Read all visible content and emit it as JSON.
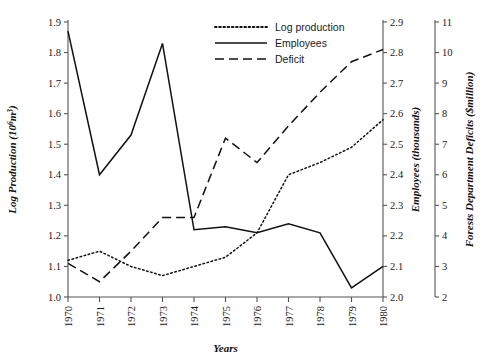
{
  "chart_data": {
    "type": "line",
    "title": "",
    "xlabel": "Years",
    "grid": false,
    "legend_position": "top-center",
    "categories": [
      1970,
      1971,
      1972,
      1973,
      1974,
      1975,
      1976,
      1977,
      1978,
      1979,
      1980
    ],
    "x_tick_labels": [
      "1970",
      "1971",
      "1972",
      "1973",
      "1974",
      "1975",
      "1976",
      "1977",
      "1978",
      "1979",
      "1980"
    ],
    "axes": [
      {
        "id": "left",
        "label": "Log Production (10⁶m³)",
        "label_plain": "Log Production",
        "label_unit_base": "(10",
        "label_unit_exp": "6",
        "label_unit_tail": "m",
        "label_unit_exp2": "3",
        "label_unit_close": ")",
        "side": "left",
        "lim": [
          1.0,
          1.9
        ],
        "ticks": [
          "1.0",
          "1.1",
          "1.2",
          "1.3",
          "1.4",
          "1.5",
          "1.6",
          "1.7",
          "1.8",
          "1.9"
        ],
        "tick_values": [
          1.0,
          1.1,
          1.2,
          1.3,
          1.4,
          1.5,
          1.6,
          1.7,
          1.8,
          1.9
        ]
      },
      {
        "id": "right1",
        "label": "Employees (thousands)",
        "side": "right",
        "lim": [
          2.0,
          2.9
        ],
        "ticks": [
          "2.0",
          "2.1",
          "2.2",
          "2.3",
          "2.4",
          "2.5",
          "2.6",
          "2.7",
          "2.8",
          "2.9"
        ],
        "tick_values": [
          2.0,
          2.1,
          2.2,
          2.3,
          2.4,
          2.5,
          2.6,
          2.7,
          2.8,
          2.9
        ]
      },
      {
        "id": "right2",
        "label": "Forests Department Deficits ($million)",
        "side": "right-outer",
        "lim": [
          2,
          11
        ],
        "ticks": [
          "2",
          "3",
          "4",
          "5",
          "6",
          "7",
          "8",
          "9",
          "10",
          "11"
        ],
        "tick_values": [
          2,
          3,
          4,
          5,
          6,
          7,
          8,
          9,
          10,
          11
        ]
      }
    ],
    "series": [
      {
        "name": "Log production",
        "legend_label": "Log production",
        "style": "dotted",
        "axis": "left",
        "color": "#111111",
        "values": [
          1.12,
          1.15,
          1.1,
          1.07,
          1.1,
          1.13,
          1.21,
          1.4,
          1.44,
          1.49,
          1.58
        ]
      },
      {
        "name": "Employees",
        "legend_label": "Employees",
        "style": "solid",
        "axis": "right1",
        "color": "#111111",
        "values": [
          2.87,
          2.4,
          2.53,
          2.83,
          2.22,
          2.23,
          2.21,
          2.24,
          2.21,
          2.03,
          2.1
        ]
      },
      {
        "name": "Deficit",
        "legend_label": "Deficit",
        "style": "dashed",
        "axis": "right1",
        "color": "#111111",
        "values_on_employee_scale": [
          2.11,
          2.05,
          2.15,
          2.26,
          2.26,
          2.52,
          2.44,
          2.56,
          2.67,
          2.77,
          2.81
        ],
        "values": [
          3.1,
          2.5,
          3.5,
          4.6,
          4.6,
          7.2,
          6.4,
          7.6,
          8.7,
          9.7,
          10.1
        ]
      }
    ]
  }
}
